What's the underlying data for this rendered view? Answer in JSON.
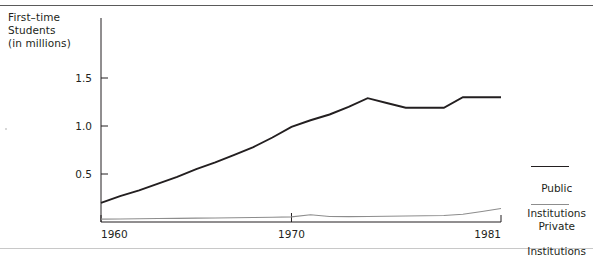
{
  "figure": {
    "axis_caption_lines": [
      "First–time",
      "Students",
      "(in millions)"
    ],
    "axis_caption": "First–time\nStudents\n(in millions)"
  },
  "legend": {
    "public": {
      "line1": "Public",
      "line2": "Institutions",
      "color": "#231f20"
    },
    "private": {
      "line1": "Private",
      "line2": "Institutions",
      "color": "#8d8d8d"
    }
  },
  "chart_data": {
    "type": "line",
    "title": "First–time Students (in millions)",
    "xlabel": "",
    "ylabel": "First–time Students (in millions)",
    "xlim": [
      1960,
      1981
    ],
    "ylim": [
      0,
      1.62
    ],
    "grid": false,
    "legend_position": "right",
    "x_ticks": [
      1960,
      1970,
      1981
    ],
    "x_tick_labels": [
      "1960",
      "1970",
      "1981"
    ],
    "y_ticks": [
      0.5,
      1.0,
      1.5
    ],
    "y_tick_labels": [
      "0.5",
      "1.0",
      "1.5"
    ],
    "x": [
      1960,
      1961,
      1962,
      1963,
      1964,
      1965,
      1966,
      1967,
      1968,
      1969,
      1970,
      1971,
      1972,
      1973,
      1974,
      1975,
      1976,
      1977,
      1978,
      1979,
      1980,
      1981
    ],
    "series": [
      {
        "name": "Public Institutions",
        "color": "#231f20",
        "values": [
          0.2,
          0.27,
          0.33,
          0.4,
          0.47,
          0.55,
          0.62,
          0.7,
          0.78,
          0.88,
          0.99,
          1.06,
          1.12,
          1.2,
          1.29,
          1.24,
          1.19,
          1.19,
          1.19,
          1.3,
          1.3,
          1.3
        ]
      },
      {
        "name": "Private Institutions",
        "color": "#8d8d8d",
        "values": [
          0.03,
          0.032,
          0.034,
          0.036,
          0.038,
          0.04,
          0.042,
          0.044,
          0.047,
          0.05,
          0.053,
          0.075,
          0.058,
          0.056,
          0.058,
          0.06,
          0.062,
          0.065,
          0.068,
          0.08,
          0.11,
          0.14
        ]
      }
    ]
  }
}
